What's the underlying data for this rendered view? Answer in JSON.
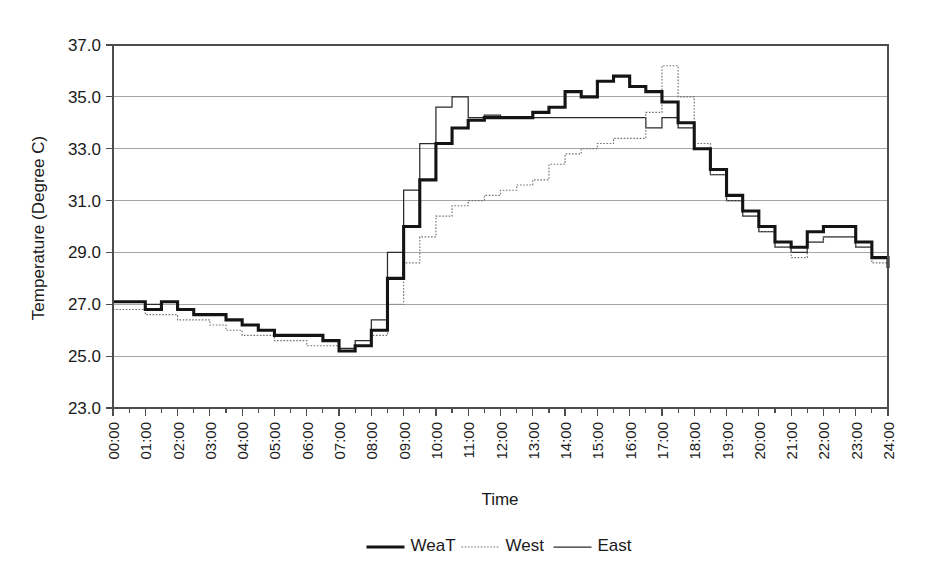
{
  "chart_data": {
    "type": "line",
    "title": "",
    "xlabel": "Time",
    "ylabel": "Temperature (Degree C)",
    "ylim": [
      23.0,
      37.0
    ],
    "ytick_step": 2.0,
    "yticks": [
      "23.0",
      "25.0",
      "27.0",
      "29.0",
      "31.0",
      "33.0",
      "35.0",
      "37.0"
    ],
    "xlim": [
      "00:00",
      "24:00"
    ],
    "grid": "horizontal",
    "legend_position": "bottom-center",
    "x": [
      "00:00",
      "00:30",
      "01:00",
      "01:30",
      "02:00",
      "02:30",
      "03:00",
      "03:30",
      "04:00",
      "04:30",
      "05:00",
      "05:30",
      "06:00",
      "06:30",
      "07:00",
      "07:30",
      "08:00",
      "08:30",
      "09:00",
      "09:30",
      "10:00",
      "10:30",
      "11:00",
      "11:30",
      "12:00",
      "12:30",
      "13:00",
      "13:30",
      "14:00",
      "14:30",
      "15:00",
      "15:30",
      "16:00",
      "16:30",
      "17:00",
      "17:30",
      "18:00",
      "18:30",
      "19:00",
      "19:30",
      "20:00",
      "20:30",
      "21:00",
      "21:30",
      "22:00",
      "22:30",
      "23:00",
      "23:30",
      "24:00"
    ],
    "xticks": [
      "00:00",
      "01:00",
      "02:00",
      "03:00",
      "04:00",
      "05:00",
      "06:00",
      "07:00",
      "08:00",
      "09:00",
      "10:00",
      "11:00",
      "12:00",
      "13:00",
      "14:00",
      "15:00",
      "16:00",
      "17:00",
      "18:00",
      "19:00",
      "20:00",
      "21:00",
      "22:00",
      "23:00",
      "24:00"
    ],
    "series": [
      {
        "name": "WeaT",
        "style": "thick-solid",
        "color": "#141414",
        "values": [
          27.1,
          27.1,
          26.8,
          27.1,
          26.8,
          26.6,
          26.6,
          26.4,
          26.2,
          26.0,
          25.8,
          25.8,
          25.8,
          25.6,
          25.2,
          25.4,
          26.0,
          28.0,
          30.0,
          31.8,
          33.2,
          33.8,
          34.1,
          34.2,
          34.2,
          34.2,
          34.4,
          34.6,
          35.2,
          35.0,
          35.6,
          35.8,
          35.4,
          35.2,
          34.8,
          34.0,
          33.0,
          32.2,
          31.2,
          30.6,
          30.0,
          29.4,
          29.2,
          29.8,
          30.0,
          30.0,
          29.4,
          28.8,
          28.4
        ]
      },
      {
        "name": "West",
        "style": "dotted",
        "color": "#737373",
        "values": [
          26.8,
          26.8,
          26.6,
          26.6,
          26.4,
          26.4,
          26.2,
          26.0,
          25.8,
          25.8,
          25.6,
          25.6,
          25.4,
          25.4,
          25.2,
          25.4,
          25.8,
          27.0,
          28.6,
          29.6,
          30.4,
          30.8,
          31.0,
          31.2,
          31.4,
          31.6,
          31.8,
          32.4,
          32.8,
          33.0,
          33.2,
          33.4,
          33.4,
          34.4,
          36.2,
          35.0,
          33.2,
          32.0,
          31.0,
          30.4,
          29.8,
          29.2,
          28.8,
          29.4,
          29.6,
          29.6,
          29.2,
          28.6,
          28.2
        ]
      },
      {
        "name": "East",
        "style": "thin-solid",
        "color": "#2b2b2b",
        "values": [
          27.1,
          27.1,
          27.0,
          27.1,
          26.8,
          26.6,
          26.6,
          26.4,
          26.2,
          26.0,
          25.8,
          25.8,
          25.8,
          25.6,
          25.3,
          25.6,
          26.4,
          29.0,
          31.4,
          33.2,
          34.6,
          35.0,
          34.2,
          34.3,
          34.2,
          34.2,
          34.2,
          34.2,
          34.2,
          34.2,
          34.2,
          34.2,
          34.2,
          33.8,
          34.2,
          33.8,
          33.0,
          32.0,
          31.0,
          30.4,
          29.8,
          29.2,
          29.0,
          29.4,
          29.6,
          29.6,
          29.2,
          28.8,
          28.3
        ]
      }
    ]
  },
  "legend": {
    "items": [
      {
        "label": "WeaT"
      },
      {
        "label": "West"
      },
      {
        "label": "East"
      }
    ]
  },
  "axes": {
    "y_title": "Temperature (Degree C)",
    "x_title": "Time"
  }
}
